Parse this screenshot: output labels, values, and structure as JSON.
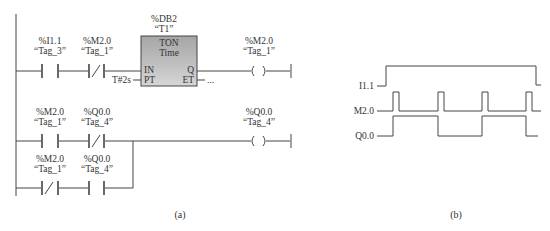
{
  "ladder": {
    "network1": {
      "contact1": {
        "address": "%I1.1",
        "tag": "“Tag_3”",
        "type": "normally-open"
      },
      "contact2": {
        "address": "%M2.0",
        "tag": "“Tag_1”",
        "type": "normally-closed"
      },
      "timer": {
        "db": "%DB2",
        "name": "“T1”",
        "type": "TON",
        "subtype": "Time",
        "in_label": "IN",
        "pt_label": "PT",
        "q_label": "Q",
        "et_label": "ET",
        "pt_value": "T#2s",
        "et_value": "..."
      },
      "coil": {
        "address": "%M2.0",
        "tag": "“Tag_1”"
      }
    },
    "network2": {
      "row1_contact1": {
        "address": "%M2.0",
        "tag": "“Tag_1”",
        "type": "normally-open"
      },
      "row1_contact2": {
        "address": "%Q0.0",
        "tag": "“Tag_4”",
        "type": "normally-closed"
      },
      "row2_contact1": {
        "address": "%M2.0",
        "tag": "“Tag_1”",
        "type": "normally-closed"
      },
      "row2_contact2": {
        "address": "%Q0.0",
        "tag": "“Tag_4”",
        "type": "normally-open"
      },
      "coil": {
        "address": "%Q0.0",
        "tag": "“Tag_4”"
      }
    },
    "caption": "(a)"
  },
  "timing": {
    "signals": [
      {
        "name": "I1.1"
      },
      {
        "name": "M2.0"
      },
      {
        "name": "Q0.0"
      }
    ],
    "caption": "(b)"
  },
  "colors": {
    "line": "#444444",
    "block_top": "#a8a8a8",
    "block_bottom": "#d0d0d0"
  }
}
